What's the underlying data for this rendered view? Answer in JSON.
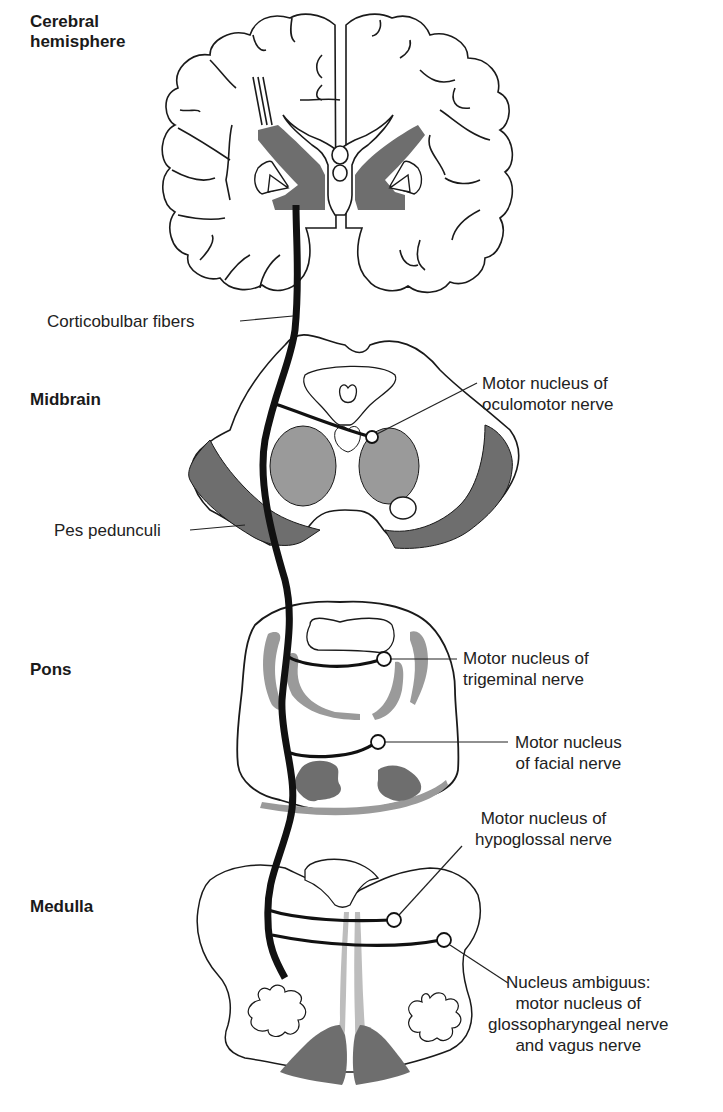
{
  "regions": {
    "cerebral": "Cerebral\nhemisphere",
    "midbrain": "Midbrain",
    "pons": "Pons",
    "medulla": "Medulla"
  },
  "labels": {
    "corticobulbar": "Corticobulbar fibers",
    "pes_pedunculi": "Pes pedunculi",
    "oculomotor": "Motor nucleus of\noculomotor nerve",
    "trigeminal": "Motor nucleus of\ntrigeminal nerve",
    "facial": "Motor nucleus\nof facial nerve",
    "hypoglossal": "Motor nucleus of\nhypoglossal nerve",
    "ambiguus": "Nucleus ambiguus:\nmotor nucleus of\nglossopharyngeal nerve\nand vagus nerve"
  },
  "colors": {
    "outline": "#1a1a1a",
    "tract_dark": "#6e6e6e",
    "nucleus_gray": "#9a9a9a",
    "light_gray": "#bdbdbd",
    "fiber": "#111111"
  }
}
